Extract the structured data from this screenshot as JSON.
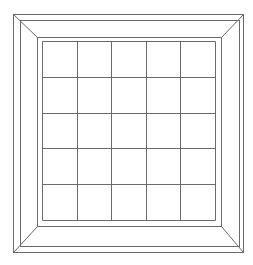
{
  "canvas": {
    "width": 253,
    "height": 265,
    "background": "#ffffff"
  },
  "style": {
    "stroke": "#6a6a6a",
    "stroke_width": 1
  },
  "frame": {
    "outer_rect": {
      "x1": 13.5,
      "y1": 14.5,
      "x2": 243.5,
      "y2": 252.5
    },
    "second_rect": {
      "x1": 20.5,
      "y1": 20.5,
      "x2": 239.5,
      "y2": 246.5
    },
    "inner_rect": {
      "x1": 37.5,
      "y1": 37.5,
      "x2": 221.5,
      "y2": 226.5
    }
  },
  "grid": {
    "x1": 42.5,
    "y1": 41.5,
    "x2": 215.5,
    "y2": 220.5,
    "rows": 5,
    "cols": 5
  }
}
